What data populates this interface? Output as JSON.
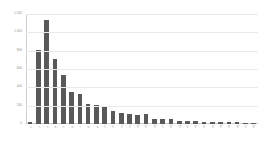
{
  "chart_data": {
    "type": "bar",
    "title": "",
    "subtitle": "",
    "xlabel": "",
    "ylabel": "",
    "ylim": [
      0,
      1200
    ],
    "grid": true,
    "legend": false,
    "legend_position": "none",
    "bar_color": "#595959",
    "gridline_color": "#e9e9e9",
    "axis_color": "#cfcfcf",
    "tick_label_color": "#909090",
    "ytick_labels": [
      "1,200",
      "1,000",
      "800",
      "600",
      "400",
      "200",
      "0"
    ],
    "ytick_values": [
      1200,
      1000,
      800,
      600,
      400,
      200,
      0
    ],
    "categories": [
      "1",
      "2",
      "3",
      "4",
      "5",
      "6",
      "7",
      "8",
      "9",
      "10",
      "11",
      "12",
      "13",
      "14",
      "15",
      "16",
      "17",
      "18",
      "19",
      "20",
      "21",
      "22",
      "23",
      "24",
      "25",
      "26",
      "27",
      "28"
    ],
    "values": [
      20,
      810,
      1130,
      710,
      540,
      350,
      330,
      215,
      210,
      195,
      140,
      120,
      105,
      100,
      105,
      60,
      52,
      55,
      32,
      30,
      28,
      26,
      24,
      22,
      20,
      18,
      16,
      12
    ]
  }
}
